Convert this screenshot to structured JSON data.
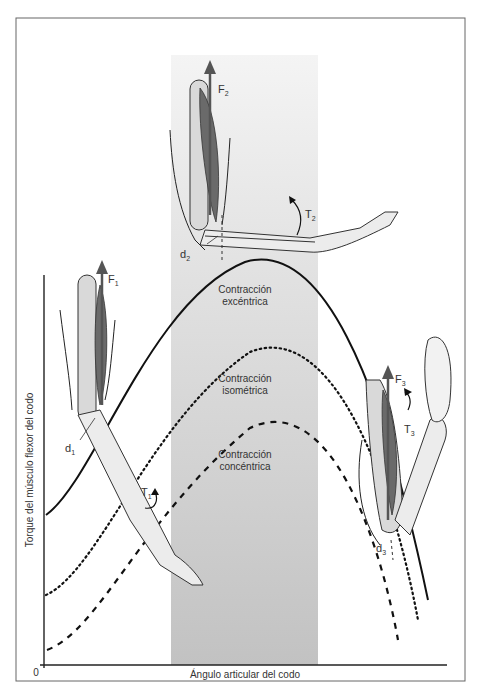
{
  "figure": {
    "y_axis_label": "Torque del músculo flexor del codo",
    "x_axis_label": "Ángulo articular del codo",
    "origin_label": "0",
    "band_color_top": "#f2f2f2",
    "band_color_bottom": "#c4c4c4"
  },
  "curves": [
    {
      "name": "Contracción excéntrica",
      "line1": "Contracción",
      "line2": "excéntrica",
      "style": "solid"
    },
    {
      "name": "Contracción isométrica",
      "line1": "Contracción",
      "line2": "isométrica",
      "style": "dotted"
    },
    {
      "name": "Contracción concéntrica",
      "line1": "Contracción",
      "line2": "concéntrica",
      "style": "dashed"
    }
  ],
  "arms": [
    {
      "position": "left",
      "force": "F",
      "force_sub": "1",
      "torque": "T",
      "torque_sub": "1",
      "distance": "d",
      "distance_sub": "1"
    },
    {
      "position": "top",
      "force": "F",
      "force_sub": "2",
      "torque": "T",
      "torque_sub": "2",
      "distance": "d",
      "distance_sub": "2"
    },
    {
      "position": "right",
      "force": "F",
      "force_sub": "3",
      "torque": "T",
      "torque_sub": "3",
      "distance": "d",
      "distance_sub": "3"
    }
  ]
}
